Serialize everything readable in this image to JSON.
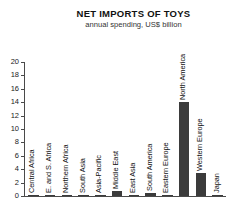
{
  "header": {
    "title": "NET IMPORTS OF TOYS",
    "subtitle": "annual spending, US$ billion"
  },
  "chart_data": {
    "type": "bar",
    "title": "NET IMPORTS OF TOYS",
    "subtitle": "annual spending, US$ billion",
    "xlabel": "",
    "ylabel": "",
    "ylim": [
      0,
      20
    ],
    "ytick_step": 2,
    "grid": false,
    "legend": "none",
    "bar_color": "#3b3b3b",
    "yticks": [
      "0",
      "2",
      "4",
      "6",
      "8",
      "10",
      "12",
      "14",
      "16",
      "18",
      "20"
    ],
    "categories": [
      "Central Africa",
      "E. and S. Africa",
      "Northern Africa",
      "South Asia",
      "Asia-Pacific",
      "Middle East",
      "East Asia",
      "South America",
      "Eastern Europe",
      "North America",
      "Western Europe",
      "Japan"
    ],
    "values": [
      0.1,
      0.15,
      0.15,
      0.2,
      0.2,
      0.8,
      0.2,
      0.5,
      0.2,
      14.0,
      3.5,
      0.1
    ]
  }
}
